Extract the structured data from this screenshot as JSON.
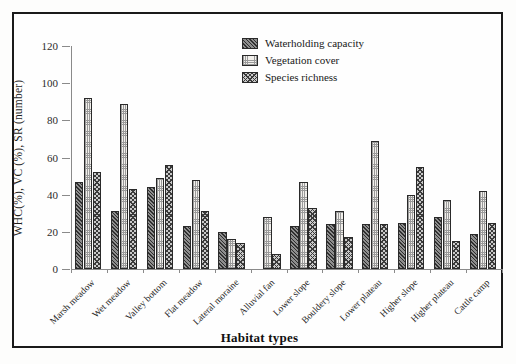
{
  "chart_data": {
    "type": "bar",
    "title": "",
    "xlabel": "Habitat types",
    "ylabel": "WHC(%), VC (%), SR (number)",
    "ylim": [
      0,
      120
    ],
    "yticks": [
      0,
      20,
      40,
      60,
      80,
      100,
      120
    ],
    "grid": false,
    "legend_position": "top-right",
    "categories": [
      "Marsh meadow",
      "Wet meadow",
      "Valley bottom",
      "Flat meadow",
      "Lateral moraine",
      "Alluvial fan",
      "Lower slope",
      "Bouldery slope",
      "Lower plateau",
      "Higher slope",
      "Higher plateau",
      "Cattle camp"
    ],
    "series": [
      {
        "name": "Waterholding capacity",
        "pattern": "diagonal-hatch",
        "values": [
          47,
          31,
          44,
          23,
          20,
          0,
          23,
          24,
          24,
          25,
          28,
          19
        ]
      },
      {
        "name": "Vegetation cover",
        "pattern": "dotted-stipple",
        "values": [
          92,
          89,
          49,
          48,
          16,
          28,
          47,
          31,
          69,
          40,
          37,
          42
        ]
      },
      {
        "name": "Species richness",
        "pattern": "crosshatch",
        "values": [
          52,
          43,
          56,
          31,
          14,
          8,
          33,
          17,
          24,
          55,
          15,
          25
        ]
      }
    ]
  },
  "legend": {
    "items": [
      {
        "label": "Waterholding capacity"
      },
      {
        "label": "Vegetation cover"
      },
      {
        "label": "Species richness"
      }
    ]
  },
  "colors": {
    "frame": "#1a1a1a",
    "axis": "#8a8a8a",
    "series_dark": "#2f2f2f",
    "series_light": "#f2f0ec",
    "series_mid": "#c9c9c9",
    "background": "#fefefe"
  }
}
